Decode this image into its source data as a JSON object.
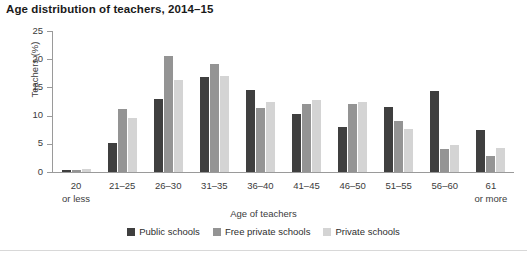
{
  "chart_data": {
    "type": "bar",
    "title": "Age distribution of teachers, 2014–15",
    "xlabel": "Age of teachers",
    "ylabel": "Teachers (%)",
    "ylim": [
      0,
      25
    ],
    "yticks": [
      0,
      5,
      10,
      15,
      20,
      25
    ],
    "grid": false,
    "legend_position": "bottom-center",
    "categories": [
      "20 or less",
      "21–25",
      "26–30",
      "31–35",
      "36–40",
      "41–45",
      "46–50",
      "51–55",
      "56–60",
      "61 or more"
    ],
    "category_lines": [
      [
        "20",
        "or less"
      ],
      [
        "21–25",
        ""
      ],
      [
        "26–30",
        ""
      ],
      [
        "31–35",
        ""
      ],
      [
        "36–40",
        ""
      ],
      [
        "41–45",
        ""
      ],
      [
        "46–50",
        ""
      ],
      [
        "51–55",
        ""
      ],
      [
        "56–60",
        ""
      ],
      [
        "61",
        "or more"
      ]
    ],
    "series": [
      {
        "name": "Public schools",
        "color": "#3f3f3f",
        "values": [
          0.3,
          5.1,
          13.0,
          16.8,
          14.5,
          10.2,
          7.9,
          11.6,
          14.3,
          7.4
        ]
      },
      {
        "name": "Free private schools",
        "color": "#949494",
        "values": [
          0.4,
          11.1,
          20.6,
          19.2,
          11.3,
          12.0,
          12.1,
          9.0,
          4.0,
          2.8
        ]
      },
      {
        "name": "Private schools",
        "color": "#d4d4d4",
        "values": [
          0.5,
          9.5,
          16.4,
          17.0,
          12.5,
          12.8,
          12.4,
          7.6,
          4.8,
          4.3
        ]
      }
    ]
  }
}
